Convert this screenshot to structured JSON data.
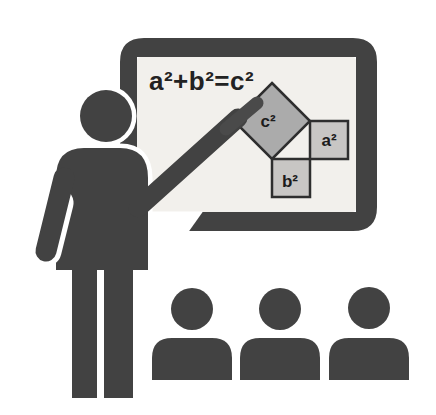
{
  "illustration": {
    "title": "Teacher pointing at a whiteboard with the Pythagorean theorem, three students watching",
    "board": {
      "formula": "a²+b²=c²",
      "diagram": {
        "hypotenuse_square_label": "c²",
        "leg_a_square_label": "a²",
        "leg_b_square_label": "b²"
      }
    },
    "figures": {
      "teacher_count": "1",
      "student_count": "3"
    }
  },
  "colors": {
    "silhouette": "#424242",
    "frame": "#424242",
    "board_interior": "#f2f0ec",
    "square_c_fill": "#ababab",
    "square_leg_fill": "#c8c6c4",
    "shape_outline": "#2e2e2e",
    "label_text": "#1c1c1c",
    "formula_text": "#222222",
    "pointer": "#4a4a4a",
    "halo": "#ffffff",
    "background": "#ffffff"
  }
}
